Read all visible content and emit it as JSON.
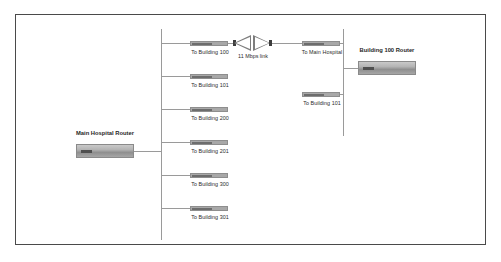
{
  "diagram": {
    "border_color": "#4a4a4a",
    "wire_color": "#9a9a9a",
    "background": "#ffffff",
    "main_hospital": {
      "router": {
        "label": "Main Hospital Router",
        "icon": "router-icon"
      },
      "switches": [
        {
          "label": "To Building 100",
          "icon": "switch-icon"
        },
        {
          "label": "To Building 101",
          "icon": "switch-icon"
        },
        {
          "label": "To Building 200",
          "icon": "switch-icon"
        },
        {
          "label": "To Building 201",
          "icon": "switch-icon"
        },
        {
          "label": "To Building 300",
          "icon": "switch-icon"
        },
        {
          "label": "To Building 301",
          "icon": "switch-icon"
        }
      ]
    },
    "wireless_link": {
      "label": "11 Mbps link",
      "left_antenna_icon": "antenna-icon",
      "right_antenna_icon": "antenna-icon"
    },
    "building_100": {
      "router": {
        "label": "Building 100 Router",
        "icon": "router-icon"
      },
      "switches": [
        {
          "label": "To Main Hospital",
          "icon": "switch-icon"
        },
        {
          "label": "To Building 101",
          "icon": "switch-icon"
        }
      ]
    }
  }
}
